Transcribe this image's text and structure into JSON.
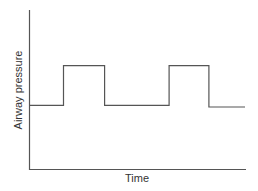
{
  "chart_data": {
    "type": "line",
    "title": "",
    "xlabel": "Time",
    "ylabel": "Airway pressure",
    "x": [
      0,
      15.6,
      15.6,
      34.7,
      34.7,
      64.7,
      64.7,
      83.2,
      83.2,
      100
    ],
    "series": [
      {
        "name": "Airway pressure",
        "values": [
          40,
          40,
          65,
          65,
          40,
          40,
          65,
          65,
          39,
          39
        ]
      }
    ],
    "xlim": [
      0,
      100
    ],
    "ylim": [
      0,
      100
    ],
    "grid": false,
    "legend": "none",
    "tick_labels": false,
    "line_color": "#555555",
    "axis_color": "#555555"
  },
  "labels": {
    "x_axis": "Time",
    "y_axis": "Airway pressure"
  }
}
